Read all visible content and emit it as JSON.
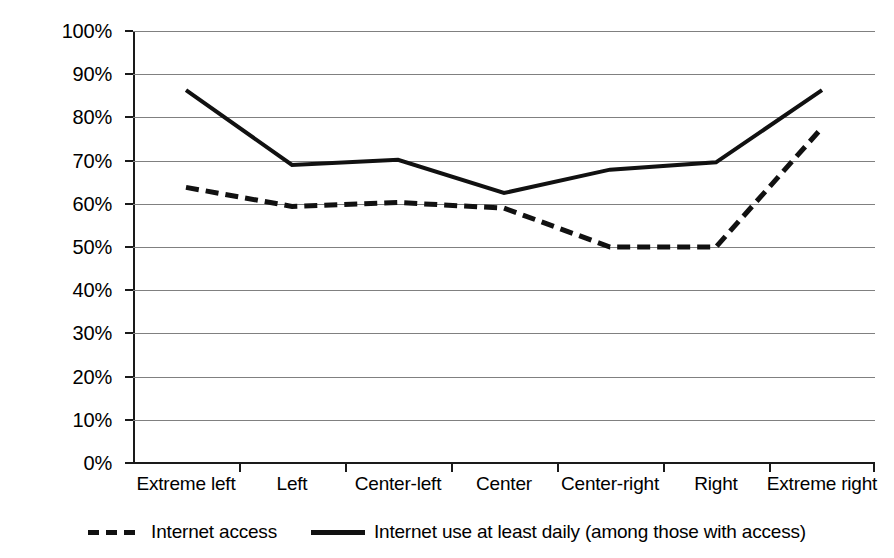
{
  "chart_data": {
    "type": "line",
    "title": "",
    "subtitle": "",
    "xlabel": "",
    "ylabel": "",
    "ylim": [
      0,
      100
    ],
    "y_tick_labels": [
      "100%",
      "90%",
      "80%",
      "70%",
      "60%",
      "50%",
      "40%",
      "30%",
      "20%",
      "10%",
      "0%"
    ],
    "y_tick_values": [
      100,
      90,
      80,
      70,
      60,
      50,
      40,
      30,
      20,
      10,
      0
    ],
    "grid": true,
    "legend_position": "bottom",
    "categories": [
      "Extreme left",
      "Left",
      "Center-left",
      "Center",
      "Center-right",
      "Right",
      "Extreme right"
    ],
    "series": [
      {
        "name": "Internet access",
        "style": "dashed",
        "color": "#111111",
        "values": [
          63.8,
          59.4,
          60.3,
          59.0,
          50.0,
          50.0,
          77.6
        ]
      },
      {
        "name": "Internet use at least daily (among those with access)",
        "style": "solid",
        "color": "#111111",
        "values": [
          86.3,
          69.0,
          70.2,
          62.5,
          67.9,
          69.6,
          86.3
        ]
      }
    ]
  },
  "legend": {
    "items": [
      {
        "label": "Internet access",
        "style": "dashed"
      },
      {
        "label": "Internet use at least daily (among those with access)",
        "style": "solid"
      }
    ]
  },
  "colors": {
    "series_line": "#111111",
    "gridline": "#808080",
    "axis": "#1a1a1a",
    "background": "#ffffff"
  }
}
